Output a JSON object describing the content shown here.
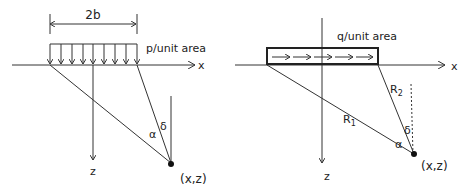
{
  "left_diagram": {
    "width_label": "2b",
    "load_label": "p/unit area",
    "x_axis_label": "x",
    "z_axis_label": "z",
    "angle_alpha": "α",
    "angle_delta": "δ",
    "point_label": "(x,z)",
    "load_arrow_count": 9
  },
  "right_diagram": {
    "load_label": "q/unit area",
    "x_axis_label": "x",
    "z_axis_label": "z",
    "r1_label": "R",
    "r1_sub": "1",
    "r2_label": "R",
    "r2_sub": "2",
    "angle_alpha": "α",
    "angle_delta": "δ",
    "point_label": "(x,z)",
    "load_arrow_count": 5
  },
  "colors": {
    "line": "#333333",
    "text": "#222222"
  }
}
